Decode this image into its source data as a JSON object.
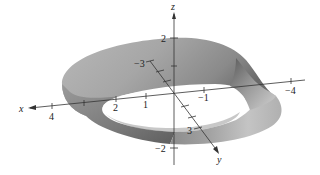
{
  "figure": {
    "axes": {
      "x": {
        "label": "x",
        "ticks": [
          {
            "label": "4",
            "pos": [
              52,
              113
            ]
          },
          {
            "label": "2",
            "pos": [
              116,
              107
            ]
          },
          {
            "label": "1",
            "pos": [
              146,
              103
            ]
          },
          {
            "label": "−1",
            "pos": [
              206,
              96
            ]
          },
          {
            "label": "−4",
            "pos": [
              293,
              90
            ]
          }
        ]
      },
      "y": {
        "label": "y",
        "ticks": [
          {
            "label": "−3",
            "pos": [
              146,
              63
            ]
          },
          {
            "label": "3",
            "pos": [
              191,
              130
            ]
          }
        ]
      },
      "z": {
        "label": "z",
        "ticks": [
          {
            "label": "2",
            "pos": [
              166,
              41
            ]
          },
          {
            "label": "−2",
            "pos": [
              164,
              151
            ]
          }
        ]
      }
    },
    "colors": {
      "surface_light": "#d6d6d6",
      "surface_mid": "#a8a8a8",
      "surface_dark": "#6e6e6e",
      "axis": "#333333",
      "background": "#ffffff"
    }
  }
}
